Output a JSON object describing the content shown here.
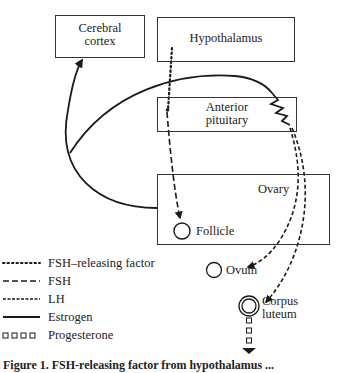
{
  "boxes": {
    "cerebral_cortex": {
      "line1": "Cerebral",
      "line2": "cortex"
    },
    "hypothalamus": {
      "label": "Hypothalamus"
    },
    "anterior_pituitary": {
      "line1": "Anterior",
      "line2": "pituitary"
    },
    "ovary": {
      "label": "Ovary"
    }
  },
  "structures": {
    "follicle": "Follicle",
    "ovum": "Ovum",
    "corpus_luteum_line1": "Corpus",
    "corpus_luteum_line2": "luteum"
  },
  "legend": [
    {
      "key": "fsh_releasing_factor",
      "label": "FSH–releasing factor",
      "style": "dotted"
    },
    {
      "key": "fsh",
      "label": "FSH",
      "style": "long-dash"
    },
    {
      "key": "lh",
      "label": "LH",
      "style": "short-dash"
    },
    {
      "key": "estrogen",
      "label": "Estrogen",
      "style": "solid"
    },
    {
      "key": "progesterone",
      "label": "Progesterone",
      "style": "squares"
    }
  ],
  "caption": "Figure 1.  FSH-releasing factor from hypothalamus ...",
  "colors": {
    "line": "#1a1a1a",
    "box_border": "#333333",
    "background": "#ffffff"
  }
}
